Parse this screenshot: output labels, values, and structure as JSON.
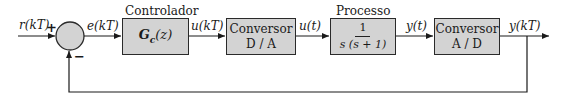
{
  "diagram": {
    "type": "closed-loop digital control block diagram",
    "signals": {
      "reference": "r(kT)",
      "error": "e(kT)",
      "control_discrete": "u(kT)",
      "control_continuous": "u(t)",
      "output_continuous": "y(t)",
      "output_discrete": "y(kT)"
    },
    "summing_junction": {
      "plus_sign": "+",
      "minus_sign": "−"
    },
    "blocks": [
      {
        "id": "controller",
        "title": "Controlador",
        "content": "G_c(z)",
        "content_main": "G",
        "content_sub": "c",
        "content_arg": "(z)"
      },
      {
        "id": "dac",
        "title": "",
        "line1": "Conversor",
        "line2": "D / A"
      },
      {
        "id": "plant",
        "title": "Processo",
        "numerator": "1",
        "denominator": "s (s + 1)"
      },
      {
        "id": "adc",
        "title": "",
        "line1": "Conversor",
        "line2": "A / D"
      }
    ],
    "colors": {
      "block_fill": "#d3d3d3",
      "stroke": "#2a2a2a",
      "background": "#ffffff"
    }
  }
}
